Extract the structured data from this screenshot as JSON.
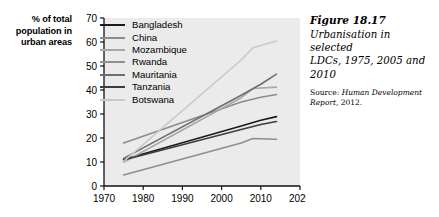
{
  "axis_caption": {
    "line1": "% of total",
    "line2": "population in",
    "line3": "urban areas"
  },
  "caption": {
    "figure_number": "Figure 18.17",
    "title_line1": "Urbanisation in selected",
    "title_line2": "LDCs, 1975, 2005 and",
    "title_line3": "2010",
    "source_prefix": "Source: ",
    "source_italic": "Human Development",
    "source_line2_italic": "Report",
    "source_line2_rest": ", 2012."
  },
  "chart_data": {
    "type": "line",
    "title": "Urbanisation in selected LDCs, 1975, 2005 and 2010",
    "xlabel": "",
    "ylabel": "% of total population in urban areas",
    "xlim": [
      1970,
      2020
    ],
    "ylim": [
      0,
      70
    ],
    "xticks": [
      1970,
      1980,
      1990,
      2000,
      2010,
      2020
    ],
    "yticks": [
      0,
      10,
      20,
      30,
      40,
      50,
      60,
      70
    ],
    "grid": false,
    "legend_position": "upper-left-inside",
    "plot_background": "#ebebeb",
    "series": [
      {
        "name": "Bangladesh",
        "color": "#1a1a1a",
        "x": [
          1975,
          2005,
          2010,
          2014
        ],
        "values": [
          11.0,
          25.0,
          27.4,
          28.9
        ]
      },
      {
        "name": "China",
        "color": "#8c8c8c",
        "x": [
          1975,
          2005,
          2010,
          2014
        ],
        "values": [
          17.9,
          35.0,
          37.0,
          38.1
        ]
      },
      {
        "name": "Mozambique",
        "color": "#a8a8a8",
        "x": [
          1975,
          2005,
          2008,
          2014
        ],
        "values": [
          9.9,
          36.8,
          40.6,
          41.2
        ]
      },
      {
        "name": "Rwanda",
        "color": "#8f8f8f",
        "x": [
          1975,
          2005,
          2008,
          2014
        ],
        "values": [
          4.6,
          17.9,
          19.8,
          19.5
        ]
      },
      {
        "name": "Mauritania",
        "color": "#6e6e6e",
        "x": [
          1975,
          2005,
          2010,
          2014
        ],
        "values": [
          11.5,
          37.8,
          42.4,
          46.6
        ]
      },
      {
        "name": "Tanzania",
        "color": "#3d3d3d",
        "x": [
          1975,
          2005,
          2010,
          2014
        ],
        "values": [
          10.8,
          23.5,
          25.6,
          26.9
        ]
      },
      {
        "name": "Botswana",
        "color": "#c9c9c9",
        "x": [
          1975,
          2005,
          2008,
          2014
        ],
        "values": [
          10.3,
          52.5,
          57.6,
          60.4
        ]
      }
    ]
  }
}
